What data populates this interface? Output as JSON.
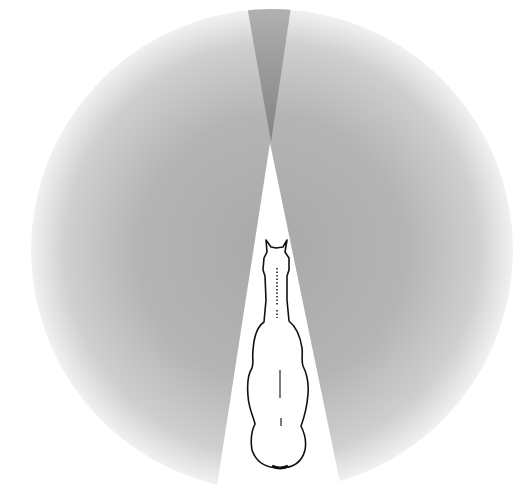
{
  "diagram": {
    "regions": [
      {
        "name": "monocular-vision-field",
        "color": "#b8b8b8"
      },
      {
        "name": "blind-spot-front",
        "color": "#8a8a8a"
      },
      {
        "name": "blind-spot-rear",
        "color": "#ffffff"
      }
    ]
  }
}
